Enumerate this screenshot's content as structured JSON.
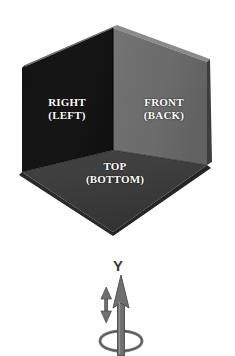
{
  "diagram": {
    "title_visible": false,
    "background_color": "#ffffff",
    "cube": {
      "faces": [
        {
          "id": "right",
          "name": "right-face",
          "primary_label": "RIGHT",
          "secondary_label": "(LEFT)",
          "fill_color": "#151515",
          "bevel_color": "#3a3a3a"
        },
        {
          "id": "front",
          "name": "front-face",
          "primary_label": "FRONT",
          "secondary_label": "(BACK)",
          "fill_color": "#6e6e6e",
          "bevel_color": "#474747"
        },
        {
          "id": "top",
          "name": "top-face",
          "primary_label": "TOP",
          "secondary_label": "(BOTTOM)",
          "fill_color": "#3c3c3c",
          "bevel_color": "#232323"
        }
      ],
      "label_text_color": "#ffffff",
      "geometry": {
        "apex": [
          113,
          28
        ],
        "left_upper": [
          22,
          68
        ],
        "right_upper": [
          207,
          62
        ],
        "center": [
          113,
          150
        ],
        "left_lower": [
          22,
          172
        ],
        "right_lower": [
          207,
          165
        ],
        "bottom": [
          113,
          232
        ]
      }
    },
    "axis": {
      "label": "Y",
      "label_color": "#3a3a3a",
      "arrow_color": "#6b6b6b",
      "arrow_outline_color": "#4a4a4a",
      "direction": "up",
      "translation_indicator": "double-headed-vertical-arrow",
      "rotation_indicator": "ellipse-ring"
    }
  }
}
